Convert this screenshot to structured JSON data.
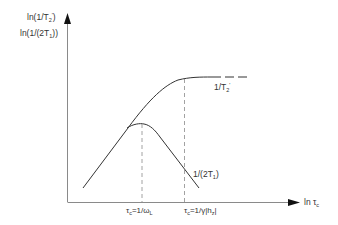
{
  "diagram": {
    "type": "relaxation-rate-vs-correlation-time",
    "y_axis": {
      "label_line1": {
        "pre": "ln(1/T",
        "sub": "2",
        "sup": "'",
        "post": ")"
      },
      "label_line2": {
        "pre": "ln(1/(2T",
        "sub": "1",
        "post": "))"
      }
    },
    "x_axis": {
      "label": {
        "pre": "ln τ",
        "sub": "c"
      }
    },
    "curves": [
      {
        "name": "1/T2'",
        "label": {
          "pre": "1/T",
          "sub": "2",
          "sup": "'"
        },
        "style": "solid-then-dashed-plateau"
      },
      {
        "name": "1/(2T1)",
        "label": {
          "pre": "1/(2T",
          "sub": "1",
          "post": ")"
        },
        "style": "solid-peak"
      }
    ],
    "markers": [
      {
        "label": {
          "pre": "τ",
          "sub1": "c",
          "mid": "=1/ω",
          "sub2": "L"
        }
      },
      {
        "label": {
          "pre": "τ",
          "sub1": "c",
          "mid": "=1/γ|h",
          "sub2": "z",
          "post": "|"
        }
      }
    ],
    "colors": {
      "line": "#333333",
      "axis": "#888888",
      "dashed": "#888888"
    }
  }
}
